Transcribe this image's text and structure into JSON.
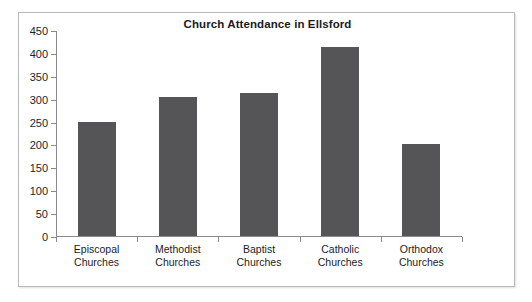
{
  "chart_data": {
    "type": "bar",
    "title": "Church Attendance in Ellsford",
    "xlabel": "",
    "ylabel": "",
    "categories": [
      "Episcopal Churches",
      "Methodist Churches",
      "Baptist Churches",
      "Catholic Churches",
      "Orthodox Churches"
    ],
    "category_lines": [
      [
        "Episcopal",
        "Churches"
      ],
      [
        "Methodist",
        "Churches"
      ],
      [
        "Baptist",
        "Churches"
      ],
      [
        "Catholic",
        "Churches"
      ],
      [
        "Orthodox",
        "Churches"
      ]
    ],
    "values": [
      250,
      303,
      313,
      412,
      200
    ],
    "ylim": [
      0,
      450
    ],
    "ytick_step": 50,
    "yticks": [
      0,
      50,
      100,
      150,
      200,
      250,
      300,
      350,
      400,
      450
    ],
    "ytick_labels": [
      "0",
      "50",
      "100",
      "150",
      "200",
      "250",
      "300",
      "350",
      "400",
      "450"
    ],
    "grid": false,
    "legend": false,
    "bar_color": "#555557",
    "axis_color": "#8a8a8a",
    "frame_color": "#b9b9b9",
    "title_color": "#1b1b1b"
  }
}
